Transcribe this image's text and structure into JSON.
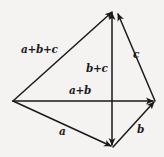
{
  "figure": {
    "kind": "vector-addition-diagram",
    "background_color": "#f4f3f1",
    "stroke_color": "#1a1a1a",
    "labels": {
      "sum_abc": "a+b+c",
      "c": "c",
      "sum_bc": "b+c",
      "sum_ab": "a+b",
      "a": "a",
      "b": "b"
    },
    "vertices": {
      "origin": [
        13,
        101
      ],
      "apex": [
        115,
        9
      ],
      "right": [
        155,
        101
      ],
      "bottom": [
        113,
        147
      ]
    },
    "edges": [
      {
        "name": "resultant-a-plus-b-plus-c",
        "from": [
          13,
          101
        ],
        "to": [
          115,
          9
        ],
        "label": "a+b+c",
        "arrowhead": "end"
      },
      {
        "name": "vector-c",
        "from": [
          155,
          101
        ],
        "to": [
          117,
          11
        ],
        "label": "c",
        "arrowhead": "end"
      },
      {
        "name": "vector-b-plus-c",
        "from": [
          112,
          101
        ],
        "to": [
          112,
          11
        ],
        "label": "b+c",
        "arrowhead": "end"
      },
      {
        "name": "vector-a-plus-b",
        "from": [
          13,
          101
        ],
        "to": [
          155,
          101
        ],
        "label": "a+b",
        "arrowhead": "end"
      },
      {
        "name": "vector-a",
        "from": [
          13,
          101
        ],
        "to": [
          113,
          147
        ],
        "label": "a",
        "arrowhead": "end"
      },
      {
        "name": "vector-b",
        "from": [
          113,
          147
        ],
        "to": [
          155,
          101
        ],
        "label": "b",
        "arrowhead": "end"
      },
      {
        "name": "edge-apex-to-bottom",
        "from": [
          112,
          101
        ],
        "to": [
          112,
          147
        ],
        "label": "",
        "arrowhead": "end"
      }
    ]
  }
}
